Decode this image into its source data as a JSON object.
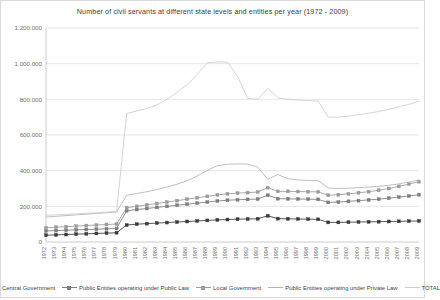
{
  "chart_data": {
    "type": "line",
    "title": "Number of civil servants at different state levels and entities per year (1972 - 2009)",
    "xlabel": "",
    "ylabel": "",
    "ylim": [
      0,
      1200000
    ],
    "ytick_labels": [
      "0",
      "200.000",
      "400.000",
      "600.000",
      "800.000",
      "1.000.000",
      "1.200.000"
    ],
    "ytick_values": [
      0,
      200000,
      400000,
      600000,
      800000,
      1000000,
      1200000
    ],
    "grid": true,
    "legend_position": "bottom",
    "categories": [
      "1972",
      "1973",
      "1974",
      "1975",
      "1976",
      "1977",
      "1978",
      "1979",
      "1980",
      "1981",
      "1982",
      "1983",
      "1984",
      "1985",
      "1986",
      "1987",
      "1988",
      "1989",
      "1990",
      "1991",
      "1992",
      "1993",
      "1994",
      "1995",
      "1996",
      "1997",
      "1998",
      "1999",
      "2000",
      "2001",
      "2002",
      "2003",
      "2004",
      "2005",
      "2006",
      "2007",
      "2008",
      "2009"
    ],
    "series": [
      {
        "name": "Central Government",
        "color": "#3a3a3a",
        "marker": "square",
        "values": [
          38000,
          40000,
          42000,
          44000,
          46000,
          48000,
          50000,
          52000,
          95000,
          100000,
          103000,
          106000,
          109000,
          112000,
          115000,
          118000,
          121000,
          124000,
          126000,
          128000,
          129000,
          130000,
          147000,
          131000,
          130000,
          129000,
          128000,
          127000,
          110000,
          110000,
          111000,
          112000,
          113000,
          114000,
          115000,
          116000,
          117000,
          118000
        ]
      },
      {
        "name": "Public Entities operating under Public Law",
        "color": "#7d7d7d",
        "marker": "square",
        "values": [
          62000,
          64000,
          66000,
          68000,
          70000,
          72000,
          74000,
          76000,
          175000,
          182000,
          188000,
          194000,
          200000,
          206000,
          212000,
          218000,
          224000,
          230000,
          234000,
          237000,
          239000,
          241000,
          262000,
          243000,
          242000,
          241000,
          240000,
          239000,
          222000,
          224000,
          228000,
          232000,
          236000,
          240000,
          246000,
          252000,
          258000,
          265000
        ]
      },
      {
        "name": "Local Government",
        "color": "#9b9b9b",
        "marker": "square",
        "values": [
          80000,
          83000,
          86000,
          89000,
          92000,
          95000,
          98000,
          101000,
          192000,
          200000,
          208000,
          216000,
          224000,
          232000,
          240000,
          248000,
          256000,
          264000,
          270000,
          274000,
          277000,
          280000,
          305000,
          284000,
          284000,
          283000,
          282000,
          281000,
          262000,
          265000,
          270000,
          276000,
          282000,
          290000,
          300000,
          312000,
          325000,
          338000
        ]
      },
      {
        "name": "Public Entities operating under Private Law",
        "color": "#b3b3b3",
        "marker": "none",
        "values": [
          140000,
          144000,
          148000,
          152000,
          156000,
          160000,
          164000,
          168000,
          262000,
          272000,
          282000,
          294000,
          308000,
          324000,
          344000,
          370000,
          402000,
          428000,
          436000,
          438000,
          437000,
          420000,
          352000,
          378000,
          355000,
          348000,
          345000,
          344000,
          302000,
          300000,
          302000,
          305000,
          308000,
          312000,
          318000,
          326000,
          336000,
          348000
        ]
      },
      {
        "name": "TOTAL",
        "color": "#cccccc",
        "marker": "none",
        "values": [
          150000,
          152000,
          155000,
          158000,
          161000,
          164000,
          168000,
          172000,
          720000,
          735000,
          748000,
          768000,
          800000,
          838000,
          882000,
          940000,
          1005000,
          1010000,
          1008000,
          930000,
          805000,
          800000,
          862000,
          808000,
          800000,
          796000,
          793000,
          790000,
          700000,
          700000,
          706000,
          714000,
          722000,
          732000,
          744000,
          758000,
          772000,
          790000
        ]
      }
    ]
  }
}
